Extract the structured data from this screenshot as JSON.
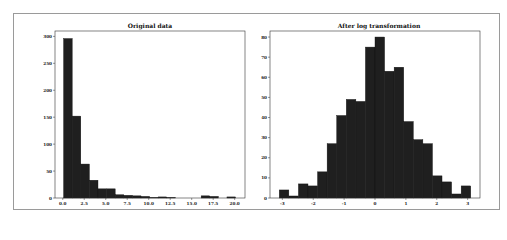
{
  "figure": {
    "panels": [
      {
        "title": "Original data"
      },
      {
        "title": "After log transformation"
      }
    ]
  },
  "chart_data": [
    {
      "type": "bar",
      "title": "Original data",
      "xlabel": "",
      "ylabel": "",
      "bin_edges_start": 0.1,
      "bin_width": 1.0,
      "values": [
        296,
        152,
        63,
        33,
        17,
        17,
        6,
        5,
        4,
        3,
        1,
        2,
        1,
        0,
        0,
        0,
        4,
        3,
        0,
        2
      ],
      "xlim": [
        -0.9,
        21.2
      ],
      "ylim": [
        0,
        310
      ],
      "xticks": [
        0.0,
        2.5,
        5.0,
        7.5,
        10.0,
        12.5,
        15.0,
        17.5,
        20.0
      ],
      "xtick_labels": [
        "0.0",
        "2.5",
        "5.0",
        "7.5",
        "10.0",
        "12.5",
        "15.0",
        "17.5",
        "20.0"
      ],
      "yticks": [
        0,
        50,
        100,
        150,
        200,
        250,
        300
      ],
      "ytick_labels": [
        "0",
        "50",
        "100",
        "150",
        "200",
        "250",
        "300"
      ],
      "bar_color": "#1f1f1f",
      "grid": false
    },
    {
      "type": "bar",
      "title": "After log transformation",
      "xlabel": "",
      "ylabel": "",
      "bin_edges_start": -3.1,
      "bin_width": 0.31,
      "values": [
        4,
        1,
        7,
        6,
        13,
        27,
        41,
        49,
        48,
        75,
        80,
        63,
        65,
        38,
        29,
        27,
        11,
        8,
        2,
        6
      ],
      "xlim": [
        -3.4,
        3.4
      ],
      "ylim": [
        0,
        83
      ],
      "xticks": [
        -3,
        -2,
        -1,
        0,
        1,
        2,
        3
      ],
      "xtick_labels": [
        "-3",
        "-2",
        "-1",
        "0",
        "1",
        "2",
        "3"
      ],
      "yticks": [
        0,
        10,
        20,
        30,
        40,
        50,
        60,
        70,
        80
      ],
      "ytick_labels": [
        "0",
        "10",
        "20",
        "30",
        "40",
        "50",
        "60",
        "70",
        "80"
      ],
      "bar_color": "#1f1f1f",
      "grid": false
    }
  ]
}
